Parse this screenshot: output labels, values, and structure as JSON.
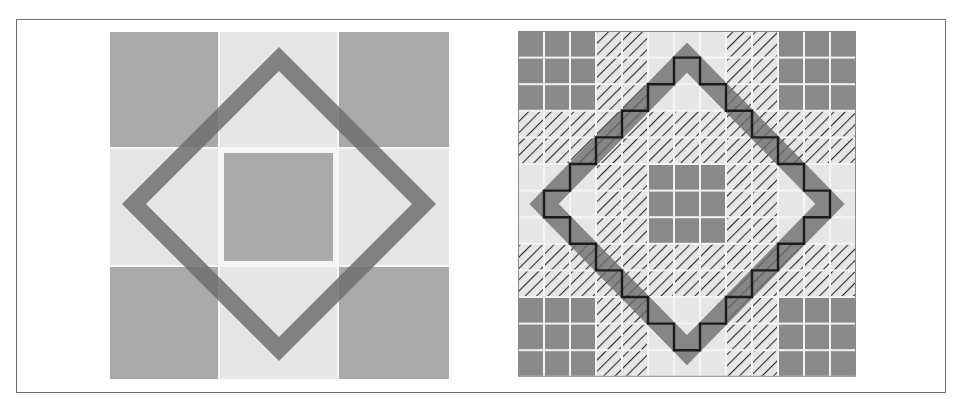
{
  "figure": {
    "panels": [
      {
        "id": "left",
        "description": "3x3 block pattern with rotated square outline",
        "grid": {
          "rows": 3,
          "cols": 3
        },
        "cells": [
          [
            "dark",
            "light",
            "dark"
          ],
          [
            "light",
            "dark",
            "light"
          ],
          [
            "dark",
            "light",
            "dark"
          ]
        ],
        "overlay": "diamond-outline"
      },
      {
        "id": "right",
        "description": "13x13 pixelated grid with solid, hatched and empty cells; diamond band with staircase approximation",
        "grid": {
          "rows": 13,
          "cols": 13
        },
        "band_pattern": [
          "dark",
          "dark",
          "dark",
          "hatch",
          "hatch",
          "light",
          "light",
          "light",
          "hatch",
          "hatch",
          "dark",
          "dark",
          "dark"
        ],
        "overlay": "diamond-band-with-staircase"
      }
    ],
    "colors": {
      "dark": "#a9a9a9",
      "light": "#e6e6e6",
      "solid_cell": "#8a8a8a",
      "hatch_line": "#2e2e2e",
      "diamond": "#6e6e6e",
      "staircase": "#1c1c1c",
      "grid_gap": "#f4f4f4",
      "frame": "#6f6f6f"
    }
  }
}
